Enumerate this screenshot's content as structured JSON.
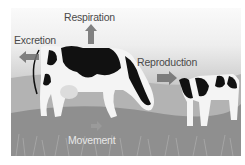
{
  "diagram": {
    "labels": {
      "respiration": "Respiration",
      "excretion": "Excretion",
      "reproduction": "Reproduction",
      "movement": "Movement"
    },
    "arrows": [
      {
        "name": "respiration-arrow",
        "direction": "up"
      },
      {
        "name": "excretion-arrow",
        "direction": "left"
      },
      {
        "name": "reproduction-arrow",
        "direction": "right"
      },
      {
        "name": "movement-arrow",
        "direction": "right"
      }
    ],
    "figures": [
      "adult-cow",
      "calf"
    ],
    "colors": {
      "arrow": "#6e6e6e",
      "label_text": "#4a4a4a",
      "movement_text": "#e8e8e8",
      "ground": "#8f8f8f"
    }
  }
}
